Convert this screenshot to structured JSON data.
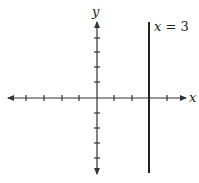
{
  "diagram": {
    "type": "coordinate-plane",
    "x_axis_label": "x",
    "y_axis_label": "y",
    "line_label_var": "x",
    "line_label_eq": " = 3",
    "vertical_line_x": 3,
    "x_ticks": [
      -4,
      -3,
      -2,
      -1,
      1,
      2,
      3,
      4
    ],
    "y_ticks": [
      -4,
      -3,
      -2,
      -1,
      1,
      2,
      3,
      4
    ],
    "colors": {
      "axis": "#333333",
      "line": "#222222",
      "background": "#ffffff"
    }
  }
}
